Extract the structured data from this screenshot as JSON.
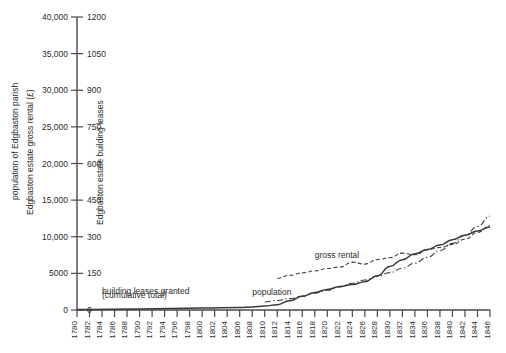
{
  "chart_data": {
    "type": "line",
    "title": "",
    "xlabel": "",
    "ylabel_left": "population of Edgbaston parish",
    "ylabel_mid": "Edgbaston estate gross rental (£)",
    "ylabel_right": "Edgbaston estate building leases",
    "grid": false,
    "legend_position": "inline-annotations",
    "x": [
      1780,
      1782,
      1784,
      1786,
      1788,
      1790,
      1792,
      1794,
      1796,
      1798,
      1800,
      1802,
      1804,
      1806,
      1808,
      1810,
      1812,
      1814,
      1816,
      1818,
      1820,
      1822,
      1824,
      1826,
      1828,
      1830,
      1832,
      1834,
      1836,
      1838,
      1840,
      1842,
      1844,
      1846
    ],
    "xtick_labels": [
      "1780",
      "1782",
      "1784",
      "1786",
      "1788",
      "1790",
      "1792",
      "1794",
      "1796",
      "1798",
      "1800",
      "1802",
      "1804",
      "1806",
      "1808",
      "1810",
      "1812",
      "1814",
      "1816",
      "1818",
      "1820",
      "1822",
      "1824",
      "1826",
      "1828",
      "1830",
      "1832",
      "1834",
      "1836",
      "1838",
      "1840",
      "1842",
      "1844",
      "1846"
    ],
    "xlim": [
      1780,
      1846
    ],
    "ylim_left": [
      0,
      40000
    ],
    "ylim_right": [
      0,
      1200
    ],
    "ytick_labels_left": [
      "0",
      "5000",
      "10,000",
      "15,000",
      "20,000",
      "25,000",
      "30,000",
      "35,000",
      "40,000"
    ],
    "ytick_values_left": [
      0,
      5000,
      10000,
      15000,
      20000,
      25000,
      30000,
      35000,
      40000
    ],
    "ytick_labels_right": [
      "0",
      "150",
      "300",
      "450",
      "600",
      "750",
      "900",
      "1050",
      "1200"
    ],
    "ytick_values_right": [
      0,
      150,
      300,
      450,
      600,
      750,
      900,
      1050,
      1200
    ],
    "series": [
      {
        "name": "gross rental",
        "style": "dashed",
        "axis": "right",
        "units": "£",
        "x": [
          1812,
          1814,
          1816,
          1818,
          1820,
          1822,
          1824,
          1826,
          1828,
          1830,
          1832,
          1834,
          1836,
          1838,
          1840,
          1842,
          1844,
          1846
        ],
        "values": [
          130,
          142,
          152,
          160,
          170,
          176,
          196,
          188,
          206,
          214,
          233,
          226,
          247,
          256,
          268,
          290,
          318,
          345
        ]
      },
      {
        "name": "building leases granted (cumulative total)",
        "style": "solid",
        "axis": "right",
        "units": "leases",
        "x": [
          1780,
          1790,
          1800,
          1806,
          1808,
          1810,
          1812,
          1814,
          1816,
          1818,
          1820,
          1822,
          1824,
          1826,
          1828,
          1830,
          1832,
          1834,
          1836,
          1838,
          1840,
          1842,
          1844,
          1846
        ],
        "values": [
          2,
          4,
          8,
          10,
          12,
          16,
          22,
          38,
          56,
          72,
          84,
          96,
          104,
          116,
          140,
          178,
          206,
          230,
          248,
          266,
          288,
          306,
          324,
          340
        ]
      },
      {
        "name": "population",
        "style": "dash-dot",
        "axis": "left",
        "units": "persons",
        "x": [
          1810,
          1812,
          1814,
          1816,
          1818,
          1820,
          1822,
          1824,
          1826,
          1828,
          1830,
          1832,
          1834,
          1836,
          1838,
          1840,
          1842,
          1844,
          1846
        ],
        "values": [
          1100,
          1300,
          1550,
          1900,
          2300,
          2700,
          3150,
          3650,
          4100,
          4600,
          5100,
          5700,
          6400,
          7200,
          8100,
          9100,
          10200,
          11400,
          12800
        ]
      }
    ],
    "annotations": [
      {
        "text": "gross rental",
        "x": 1818,
        "y_right": 212
      },
      {
        "text": "building leases granted",
        "x": 1784,
        "y_right": 64
      },
      {
        "text": "(cumulative total)",
        "x": 1784,
        "y_right": 50
      },
      {
        "text": "population",
        "x": 1808,
        "y_right": 62
      }
    ]
  },
  "colors": {
    "background": "#ffffff",
    "axis": "#4a4a4a",
    "series": "#3a3a3a",
    "text": "#2b2b2b"
  }
}
